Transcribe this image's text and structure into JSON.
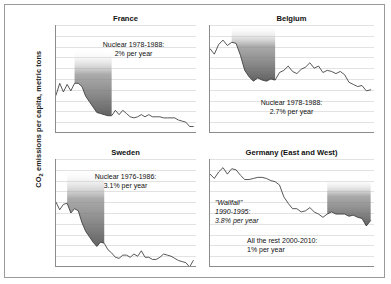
{
  "figure": {
    "ylabel": "CO2 emissions per capita, metric tons",
    "ylabel_prefix": "CO",
    "ylabel_sub": "2",
    "ylabel_rest": " emissions per capita, metric tons"
  },
  "chart_data": {
    "type": "line",
    "title": "CO2 emissions per capita, metric tons",
    "xlabel": "",
    "ylabel": "CO2 emissions per capita, metric tons",
    "xlim": [
      1973,
      2011
    ],
    "ylim": [
      5,
      15
    ],
    "yticks": [
      5,
      6,
      7,
      8,
      9,
      10,
      11,
      12,
      13,
      14,
      15
    ],
    "xticks": [
      1975,
      1990,
      2010
    ],
    "grid": true,
    "legend": "none",
    "panels": [
      {
        "name": "france",
        "title": "France",
        "annotations": [
          {
            "name": "nuclear-note",
            "line1": "Nuclear 1978-1988:",
            "line2": "2% per year",
            "style": "normal"
          }
        ],
        "shade": {
          "x0": 1978,
          "x1": 1988,
          "label": "Nuclear 1978-1988"
        },
        "x": [
          1973,
          1974,
          1975,
          1976,
          1977,
          1978,
          1979,
          1980,
          1981,
          1982,
          1983,
          1984,
          1985,
          1986,
          1987,
          1988,
          1989,
          1990,
          1991,
          1992,
          1993,
          1994,
          1995,
          1996,
          1997,
          1998,
          1999,
          2000,
          2001,
          2002,
          2003,
          2004,
          2005,
          2006,
          2007,
          2008,
          2009,
          2010
        ],
        "y": [
          8.5,
          9.6,
          8.8,
          9.5,
          8.9,
          9.6,
          9.6,
          9.3,
          8.4,
          7.9,
          7.4,
          6.9,
          6.8,
          6.7,
          6.6,
          6.6,
          7.1,
          6.7,
          7.1,
          6.8,
          6.5,
          6.4,
          6.5,
          6.7,
          6.5,
          6.7,
          6.5,
          6.5,
          6.5,
          6.4,
          6.4,
          6.4,
          6.4,
          6.2,
          6.1,
          6.0,
          5.6,
          5.6
        ]
      },
      {
        "name": "belgium",
        "title": "Belgium",
        "annotations": [
          {
            "name": "nuclear-note",
            "line1": "Nuclear 1978-1988:",
            "line2": "2.7% per year",
            "style": "normal"
          }
        ],
        "shade": {
          "x0": 1978,
          "x1": 1988,
          "label": "Nuclear 1978-1988"
        },
        "x": [
          1973,
          1974,
          1975,
          1976,
          1977,
          1978,
          1979,
          1980,
          1981,
          1982,
          1983,
          1984,
          1985,
          1986,
          1987,
          1988,
          1989,
          1990,
          1991,
          1992,
          1993,
          1994,
          1995,
          1996,
          1997,
          1998,
          1999,
          2000,
          2001,
          2002,
          2003,
          2004,
          2005,
          2006,
          2007,
          2008,
          2009,
          2010
        ],
        "y": [
          12.8,
          12.3,
          13.2,
          13.6,
          13.1,
          13.4,
          13.3,
          12.2,
          10.8,
          10.2,
          9.8,
          10.1,
          9.9,
          9.8,
          10.0,
          9.9,
          10.6,
          10.8,
          11.2,
          10.7,
          10.5,
          10.9,
          11.1,
          11.5,
          11.0,
          11.2,
          10.6,
          10.8,
          10.7,
          10.5,
          10.7,
          10.4,
          9.7,
          9.5,
          9.3,
          9.4,
          8.9,
          9.0
        ]
      },
      {
        "name": "sweden",
        "title": "Sweden",
        "annotations": [
          {
            "name": "nuclear-note",
            "line1": "Nuclear 1976-1986:",
            "line2": "3.1% per year",
            "style": "normal"
          }
        ],
        "shade": {
          "x0": 1976,
          "x1": 1986,
          "label": "Nuclear 1976-1986"
        },
        "x": [
          1973,
          1974,
          1975,
          1976,
          1977,
          1978,
          1979,
          1980,
          1981,
          1982,
          1983,
          1984,
          1985,
          1986,
          1987,
          1988,
          1989,
          1990,
          1991,
          1992,
          1993,
          1994,
          1995,
          1996,
          1997,
          1998,
          1999,
          2000,
          2001,
          2002,
          2003,
          2004,
          2005,
          2006,
          2007,
          2008,
          2009,
          2010
        ],
        "y": [
          11.0,
          10.3,
          10.8,
          10.9,
          10.0,
          10.4,
          10.2,
          9.1,
          8.3,
          7.8,
          7.3,
          6.9,
          7.3,
          7.2,
          6.6,
          6.3,
          5.9,
          5.8,
          6.1,
          6.1,
          5.9,
          6.2,
          6.0,
          6.5,
          5.9,
          5.9,
          5.7,
          5.7,
          5.9,
          6.2,
          6.1,
          6.0,
          5.8,
          5.6,
          5.5,
          5.4,
          5.0,
          5.6
        ]
      },
      {
        "name": "germany",
        "title": "Germany (East and West)",
        "annotations": [
          {
            "name": "wallfall-note",
            "line1": "\"Wallfall\"",
            "line2": "1990-1995:",
            "line3": "3.8% per year",
            "style": "italic"
          },
          {
            "name": "rest-note",
            "line1": "All the rest 2000-2010:",
            "line2": "1% per year",
            "style": "normal"
          }
        ],
        "shade": {
          "x0": 2000,
          "x1": 2010,
          "label": "All the rest 2000-2010"
        },
        "x": [
          1973,
          1974,
          1975,
          1976,
          1977,
          1978,
          1979,
          1980,
          1981,
          1982,
          1983,
          1984,
          1985,
          1986,
          1987,
          1988,
          1989,
          1990,
          1991,
          1992,
          1993,
          1994,
          1995,
          1996,
          1997,
          1998,
          1999,
          2000,
          2001,
          2002,
          2003,
          2004,
          2005,
          2006,
          2007,
          2008,
          2009,
          2010
        ],
        "y": [
          13.6,
          13.2,
          13.8,
          14.2,
          13.6,
          14.1,
          14.0,
          13.5,
          13.1,
          13.1,
          13.2,
          13.3,
          13.3,
          13.2,
          13.0,
          12.9,
          12.6,
          11.5,
          10.9,
          10.4,
          10.4,
          10.1,
          10.2,
          10.5,
          10.1,
          9.9,
          9.6,
          9.9,
          10.1,
          9.9,
          9.9,
          9.9,
          9.7,
          9.8,
          9.6,
          9.5,
          8.8,
          9.3
        ]
      }
    ]
  }
}
